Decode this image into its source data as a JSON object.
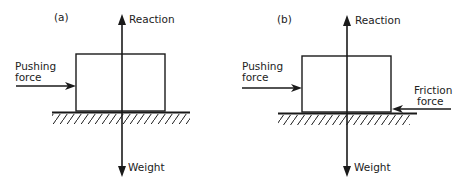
{
  "diagrams": [
    {
      "panel_label": "(a)",
      "forces": {
        "reaction": "Reaction",
        "weight": "Weight",
        "pushing_line1": "Pushing",
        "pushing_line2": "force"
      }
    },
    {
      "panel_label": "(b)",
      "forces": {
        "reaction": "Reaction",
        "weight": "Weight",
        "pushing_line1": "Pushing",
        "pushing_line2": "force",
        "friction_line1": "Friction",
        "friction_line2": "force"
      }
    }
  ],
  "colors": {
    "line": "#1a1a1a",
    "background": "#ffffff"
  }
}
